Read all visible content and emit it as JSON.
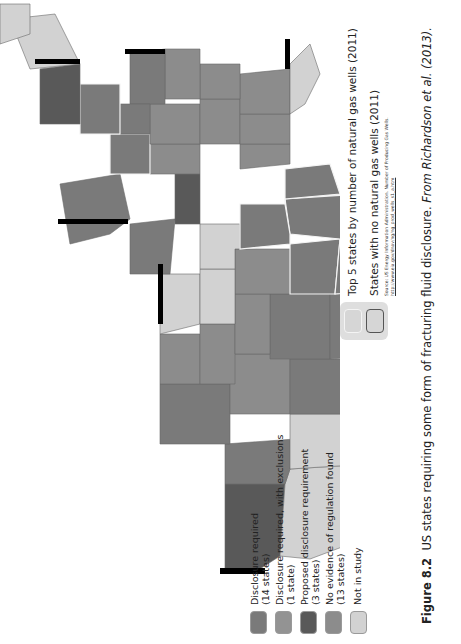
{
  "figure": {
    "number": "Figure 8.2",
    "caption": "US states requiring some form of fracturing fluid disclosure.",
    "attribution": "From Richardson et al. (2013)."
  },
  "legend_regulation": [
    {
      "label": "Disclosure required",
      "count": "(14 states)",
      "color": "#7a7a7a"
    },
    {
      "label": "Disclosure required, with exclusions",
      "count": "(1 state)",
      "color": "#939393"
    },
    {
      "label": "Proposed disclosure requirement",
      "count": "(3 states)",
      "color": "#595959"
    },
    {
      "label": "No evidence of regulation found",
      "count": "(13 states)",
      "color": "#8c8c8c"
    },
    {
      "label": "Not in study",
      "count": "",
      "color": "#d2d2d2"
    }
  ],
  "legend_gas": [
    {
      "label": "Top 5 states by number of natural gas wells (2011)",
      "border": "#f4f4f4"
    },
    {
      "label": "States with no natural gas wells (2011)",
      "border": "#555555"
    }
  ],
  "source": {
    "text": "Source: US Energy Information Administration. Number of Producing Gas Wells.",
    "link": "http://www.eia.gov/dnav/ng/ng_prod_wells_s1_a.htm"
  },
  "colors": {
    "required": "#7a7a7a",
    "exclusions": "#939393",
    "proposed": "#595959",
    "none": "#8c8c8c",
    "not_in_study": "#d2d2d2",
    "shadow": "#000000"
  }
}
